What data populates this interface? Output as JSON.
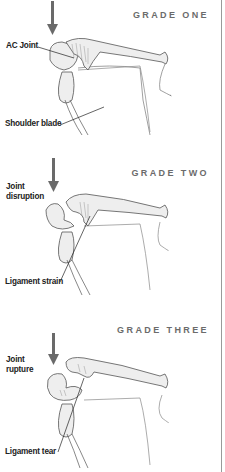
{
  "colors": {
    "bone_fill": "#eeeeee",
    "bone_stroke": "#555555",
    "arrow": "#6a6a6a",
    "title": "#6b6b6b",
    "label": "#222222",
    "border": "#9a9a9a"
  },
  "panels": [
    {
      "grade_title": "GRADE ONE",
      "labels": [
        {
          "text": "AC Joint"
        },
        {
          "text": "Shoulder blade"
        }
      ]
    },
    {
      "grade_title": "GRADE TWO",
      "labels": [
        {
          "text": "Joint\ndisruption"
        },
        {
          "text": "Ligament strain"
        }
      ]
    },
    {
      "grade_title": "GRADE THREE",
      "labels": [
        {
          "text": "Joint\nrupture"
        },
        {
          "text": "Ligament tear"
        }
      ]
    }
  ]
}
